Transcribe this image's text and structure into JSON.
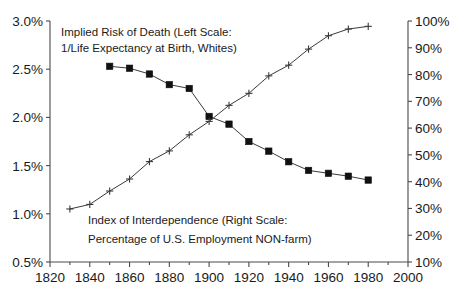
{
  "chart_data": {
    "type": "line",
    "title": "",
    "subtitle": "",
    "xlabel": "",
    "ylabel": "",
    "grid": false,
    "legend_position": "inline-annotations",
    "x": [
      1830,
      1840,
      1850,
      1860,
      1870,
      1880,
      1890,
      1900,
      1910,
      1920,
      1930,
      1940,
      1950,
      1960,
      1970,
      1980
    ],
    "x_axis": {
      "min": 1820,
      "max": 2000,
      "major_tick_step": 20,
      "minor_tick_step": 10,
      "tick_labels": [
        "1820",
        "1840",
        "1860",
        "1880",
        "1900",
        "1920",
        "1940",
        "1960",
        "1980",
        "2000"
      ],
      "tick_values": [
        1820,
        1840,
        1860,
        1880,
        1900,
        1920,
        1940,
        1960,
        1980,
        2000
      ]
    },
    "y_axis_left": {
      "min": 0.5,
      "max": 3.0,
      "unit": "%",
      "tick_step": 0.5,
      "tick_labels": [
        "0.5%",
        "1.0%",
        "1.5%",
        "2.0%",
        "2.5%",
        "3.0%"
      ],
      "tick_values": [
        0.5,
        1.0,
        1.5,
        2.0,
        2.5,
        3.0
      ]
    },
    "y_axis_right": {
      "min": 10,
      "max": 100,
      "unit": "%",
      "tick_step": 10,
      "tick_labels": [
        "10%",
        "20%",
        "30%",
        "40%",
        "50%",
        "60%",
        "70%",
        "80%",
        "90%",
        "100%"
      ],
      "tick_values": [
        10,
        20,
        30,
        40,
        50,
        60,
        70,
        80,
        90,
        100
      ]
    },
    "series": [
      {
        "name": "Implied Risk of Death",
        "axis": "left",
        "marker": "filled-square",
        "x": [
          1850,
          1860,
          1870,
          1880,
          1890,
          1900,
          1910,
          1920,
          1930,
          1940,
          1950,
          1960,
          1970,
          1980
        ],
        "values": [
          2.53,
          2.51,
          2.45,
          2.34,
          2.3,
          2.01,
          1.93,
          1.75,
          1.65,
          1.54,
          1.45,
          1.42,
          1.39,
          1.35
        ]
      },
      {
        "name": "Index of Interdependence",
        "axis": "right",
        "marker": "plus",
        "x": [
          1830,
          1840,
          1850,
          1860,
          1870,
          1880,
          1890,
          1900,
          1910,
          1920,
          1930,
          1940,
          1950,
          1960,
          1970,
          1980
        ],
        "values": [
          29.8,
          31.5,
          36.5,
          41.0,
          47.5,
          51.5,
          57.5,
          62.5,
          68.5,
          73.0,
          79.5,
          83.5,
          89.5,
          94.5,
          97.0,
          98.0
        ]
      }
    ],
    "annotations": [
      {
        "id": "death-risk-annotation",
        "line1": "Implied Risk of Death (Left Scale:",
        "line2": "1/Life Expectancy at Birth, Whites)"
      },
      {
        "id": "interdependence-annotation",
        "line1": "Index of Interdependence (Right Scale:",
        "line2": "Percentage of U.S. Employment NON-farm)"
      }
    ],
    "colors": {
      "background": "#ffffff",
      "axis": "#4a4a4a",
      "line": "#3a3a3a",
      "marker_square": "#111111",
      "text": "#1a1a1a"
    }
  }
}
